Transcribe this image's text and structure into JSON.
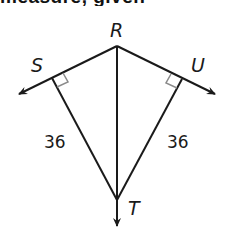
{
  "header": {
    "cropped_text": "measure, given"
  },
  "diagram": {
    "points": {
      "R": {
        "label": "R",
        "x": 117,
        "y": 46
      },
      "S": {
        "label": "S",
        "x": 52,
        "y": 78
      },
      "U": {
        "label": "U",
        "x": 182,
        "y": 79
      },
      "T": {
        "label": "T",
        "x": 117,
        "y": 200
      }
    },
    "segments": [
      {
        "from": "R",
        "to": "T"
      },
      {
        "from": "S",
        "to": "T",
        "length_label": "36"
      },
      {
        "from": "U",
        "to": "T",
        "length_label": "36"
      }
    ],
    "rays": [
      {
        "from": "R",
        "through": "S",
        "direction": "left"
      },
      {
        "from": "R",
        "through": "U",
        "direction": "right"
      },
      {
        "from": "R",
        "through": "T",
        "direction": "down"
      }
    ],
    "right_angles": [
      "S",
      "U"
    ],
    "labels": {
      "R": "R",
      "S": "S",
      "U": "U",
      "T": "T",
      "ST_length": "36",
      "UT_length": "36"
    },
    "colors": {
      "line": "#1a1a1a",
      "right_angle_mark": "#8a8a8a",
      "background": "#ffffff"
    }
  }
}
